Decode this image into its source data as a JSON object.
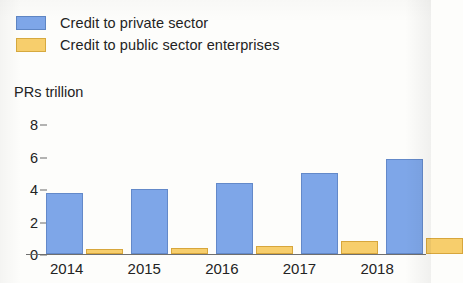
{
  "legend": {
    "position": "top-left",
    "items": [
      {
        "label": "Credit to private sector",
        "color": "#7ea6e8",
        "key": "private"
      },
      {
        "label": "Credit to public sector enterprises",
        "color": "#f7ce6c",
        "key": "public"
      }
    ]
  },
  "axis": {
    "unit_label": "PRs trillion",
    "yticks": [
      "0",
      "2",
      "4",
      "6",
      "8"
    ],
    "xlabels": [
      "2014",
      "2015",
      "2016",
      "2017",
      "2018"
    ]
  },
  "chart_data": {
    "type": "bar",
    "title": "",
    "subtitle": "",
    "xlabel": "",
    "ylabel": "PRs trillion",
    "ylim": [
      0,
      8
    ],
    "yticks": [
      0,
      2,
      4,
      6,
      8
    ],
    "grid": false,
    "legend_position": "top-left",
    "categories": [
      "2014",
      "2015",
      "2016",
      "2017",
      "2018"
    ],
    "series": [
      {
        "name": "Credit to private sector",
        "color": "#7ea6e8",
        "values": [
          3.7,
          3.95,
          4.35,
          4.95,
          5.8
        ]
      },
      {
        "name": "Credit to public sector enterprises",
        "color": "#f7ce6c",
        "values": [
          0.3,
          0.35,
          0.45,
          0.75,
          0.95
        ]
      }
    ]
  }
}
